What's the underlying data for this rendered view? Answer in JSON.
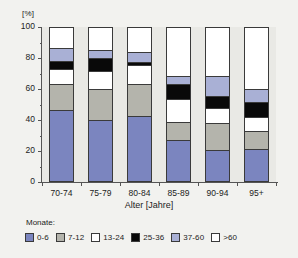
{
  "chart_data": {
    "type": "bar",
    "stacked": true,
    "stacked_mode": "percent",
    "title": "",
    "subtitle": "",
    "xlabel": "Alter [Jahre]",
    "ylabel": "[%]",
    "ylim": [
      0,
      100
    ],
    "yticks": [
      0,
      20,
      40,
      60,
      80,
      100
    ],
    "ytick_labels": [
      "0",
      "20",
      "40",
      "60",
      "80",
      "100"
    ],
    "yminor_step": 10,
    "grid": false,
    "legend_position": "bottom",
    "legend_title": "Monate:",
    "categories": [
      "70-74",
      "75-79",
      "80-84",
      "85-89",
      "90-94",
      "95+"
    ],
    "series": [
      {
        "name": "0-6",
        "color": "#7b85bf",
        "values": [
          45.5,
          39.0,
          42.0,
          26.0,
          19.5,
          20.5
        ]
      },
      {
        "name": "7-12",
        "color": "#b4b4ac",
        "values": [
          17.0,
          20.5,
          21.0,
          12.0,
          17.5,
          11.5
        ]
      },
      {
        "name": "13-24",
        "color": "#ffffff",
        "values": [
          10.0,
          11.5,
          12.5,
          15.0,
          10.0,
          9.0
        ]
      },
      {
        "name": "25-36",
        "color": "#090909",
        "values": [
          5.0,
          9.0,
          1.5,
          9.5,
          8.0,
          10.0
        ]
      },
      {
        "name": "37-60",
        "color": "#a9b0d5",
        "values": [
          8.5,
          5.0,
          6.5,
          5.5,
          13.0,
          8.5
        ]
      },
      {
        "name": ">60",
        "color": "#ffffff",
        "values": [
          14.0,
          15.0,
          16.5,
          32.0,
          32.0,
          40.5
        ]
      }
    ]
  },
  "colors": {
    "page_background": "#f2f2ef",
    "plot_background": "#e9e9e5",
    "axis": "#555555",
    "bar_outline": "#3a3a3a",
    "text": "#222222"
  }
}
